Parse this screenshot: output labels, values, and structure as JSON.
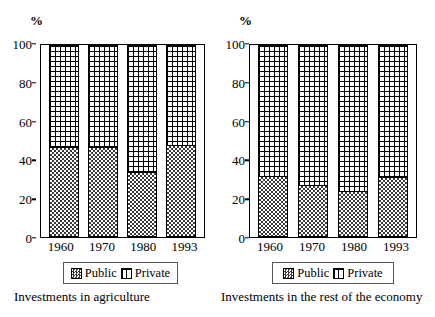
{
  "chart_data": [
    {
      "type": "bar",
      "stacked": true,
      "percent_axis_label": "%",
      "title": "",
      "caption": "Investments in agriculture",
      "categories": [
        "1960",
        "1970",
        "1980",
        "1993"
      ],
      "series": [
        {
          "name": "Public",
          "values": [
            47,
            47,
            34,
            48
          ]
        },
        {
          "name": "Private",
          "values": [
            53,
            53,
            66,
            52
          ]
        }
      ],
      "legend": [
        "Public",
        "Private"
      ],
      "legend_position": "bottom",
      "xlabel": "",
      "ylabel": "%",
      "ylim": [
        0,
        100
      ],
      "yticks": [
        0,
        20,
        40,
        60,
        80,
        100
      ],
      "grid": false
    },
    {
      "type": "bar",
      "stacked": true,
      "percent_axis_label": "%",
      "title": "",
      "caption": "Investments in the rest of the economy",
      "categories": [
        "1960",
        "1970",
        "1980",
        "1993"
      ],
      "series": [
        {
          "name": "Public",
          "values": [
            32,
            27,
            24,
            31
          ]
        },
        {
          "name": "Private",
          "values": [
            68,
            73,
            76,
            69
          ]
        }
      ],
      "legend": [
        "Public",
        "Private"
      ],
      "legend_position": "bottom",
      "xlabel": "",
      "ylabel": "%",
      "ylim": [
        0,
        100
      ],
      "yticks": [
        0,
        20,
        40,
        60,
        80,
        100
      ],
      "grid": false
    }
  ],
  "panels": [
    {
      "axis_unit": "%",
      "caption": "Investments in agriculture",
      "yticks": [
        "100",
        "80",
        "60",
        "40",
        "20",
        "0"
      ],
      "xticks": [
        "1960",
        "1970",
        "1980",
        "1993"
      ],
      "legend": {
        "public": "Public",
        "private": "Private"
      },
      "bars": [
        {
          "year": "1960",
          "public": 47,
          "private": 53
        },
        {
          "year": "1970",
          "public": 47,
          "private": 53
        },
        {
          "year": "1980",
          "public": 34,
          "private": 66
        },
        {
          "year": "1993",
          "public": 48,
          "private": 52
        }
      ]
    },
    {
      "axis_unit": "%",
      "caption": "Investments in the rest of the economy",
      "yticks": [
        "100",
        "80",
        "60",
        "40",
        "20",
        "0"
      ],
      "xticks": [
        "1960",
        "1970",
        "1980",
        "1993"
      ],
      "legend": {
        "public": "Public",
        "private": "Private"
      },
      "bars": [
        {
          "year": "1960",
          "public": 32,
          "private": 68
        },
        {
          "year": "1970",
          "public": 27,
          "private": 73
        },
        {
          "year": "1980",
          "public": 24,
          "private": 76
        },
        {
          "year": "1993",
          "public": 31,
          "private": 69
        }
      ]
    }
  ],
  "colors": {
    "ink": "#000000",
    "background": "#ffffff",
    "public_fill": "#3a3a3a",
    "private_fill": "#ffffff"
  }
}
